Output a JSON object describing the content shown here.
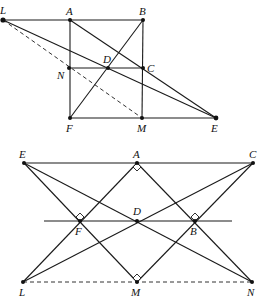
{
  "figures": [
    {
      "id": "top",
      "points": {
        "L": {
          "x": 3,
          "y": 20,
          "label": "L"
        },
        "A": {
          "x": 70,
          "y": 20,
          "label": "A"
        },
        "B": {
          "x": 143,
          "y": 20,
          "label": "B"
        },
        "N": {
          "x": 69,
          "y": 68,
          "label": "N"
        },
        "D": {
          "x": 108,
          "y": 68,
          "label": "D"
        },
        "C": {
          "x": 143,
          "y": 68,
          "label": "C"
        },
        "F": {
          "x": 70,
          "y": 118,
          "label": "F"
        },
        "M": {
          "x": 142,
          "y": 118,
          "label": "M"
        },
        "E": {
          "x": 216,
          "y": 118,
          "label": "E"
        }
      },
      "segments": [
        [
          "L",
          "B"
        ],
        [
          "A",
          "F"
        ],
        [
          "B",
          "M"
        ],
        [
          "N",
          "C"
        ],
        [
          "F",
          "E"
        ],
        [
          "L",
          "E"
        ],
        [
          "A",
          "E"
        ],
        [
          "F",
          "B"
        ]
      ],
      "dashed": [
        [
          "L",
          "M"
        ]
      ]
    },
    {
      "id": "bottom",
      "points": {
        "E": {
          "x": 24,
          "y": 163,
          "label": "E"
        },
        "A": {
          "x": 137,
          "y": 163,
          "label": "A"
        },
        "C": {
          "x": 253,
          "y": 163,
          "label": "C"
        },
        "F": {
          "x": 80,
          "y": 221,
          "label": "F"
        },
        "D": {
          "x": 137,
          "y": 221,
          "label": "D"
        },
        "B": {
          "x": 195,
          "y": 221,
          "label": "B"
        },
        "L": {
          "x": 23,
          "y": 282,
          "label": "L"
        },
        "M": {
          "x": 137,
          "y": 282,
          "label": "M"
        },
        "N": {
          "x": 252,
          "y": 282,
          "label": "N"
        }
      },
      "segments": [
        [
          "E",
          "C"
        ],
        [
          "E",
          "M"
        ],
        [
          "E",
          "N"
        ],
        [
          "A",
          "L"
        ],
        [
          "A",
          "N"
        ],
        [
          "C",
          "L"
        ],
        [
          "C",
          "M"
        ]
      ],
      "dashed": [
        [
          "L",
          "N"
        ]
      ],
      "horizontal_line": {
        "x1": 44,
        "x2": 232,
        "y": 221
      },
      "right_angles": [
        "A",
        "F",
        "B",
        "M"
      ]
    }
  ]
}
